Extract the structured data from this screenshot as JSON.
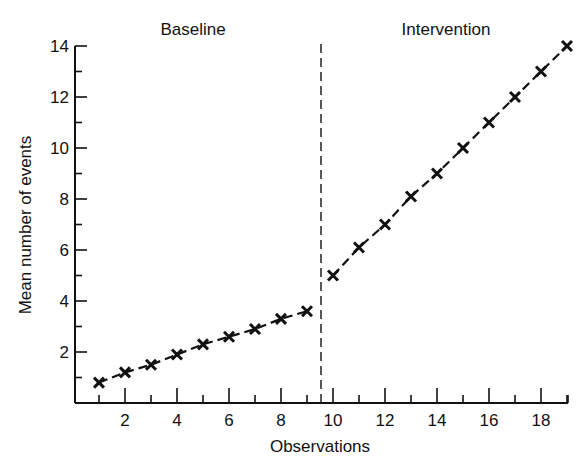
{
  "chart_data": {
    "type": "line",
    "title": "",
    "xlabel": "Observations",
    "ylabel": "Mean number of events",
    "xlim": [
      0.2,
      19.2
    ],
    "ylim": [
      0,
      14
    ],
    "x_ticks": [
      2,
      4,
      6,
      8,
      10,
      12,
      14,
      16,
      18
    ],
    "y_ticks": [
      2,
      4,
      6,
      8,
      10,
      12,
      14
    ],
    "grid": false,
    "legend": null,
    "phase_divider_x": 9.35,
    "annotations": [
      {
        "text": "Baseline",
        "x": 5
      },
      {
        "text": "Intervention",
        "x": 15
      }
    ],
    "series": [
      {
        "name": "Baseline",
        "marker": "x",
        "line": "dashed",
        "x": [
          1,
          2,
          3,
          4,
          5,
          6,
          7,
          8,
          9
        ],
        "values": [
          0.8,
          1.2,
          1.5,
          1.9,
          2.3,
          2.6,
          2.9,
          3.3,
          3.6
        ]
      },
      {
        "name": "Intervention",
        "marker": "x",
        "line": "dashed",
        "x": [
          10,
          11,
          12,
          13,
          14,
          15,
          16,
          17,
          18,
          19
        ],
        "values": [
          5.0,
          6.1,
          7.0,
          8.1,
          9.0,
          10.0,
          11.0,
          12.0,
          13.0,
          14.0
        ]
      }
    ]
  },
  "labels": {
    "xlabel": "Observations",
    "ylabel": "Mean number of events",
    "phase_baseline": "Baseline",
    "phase_intervention": "Intervention"
  }
}
